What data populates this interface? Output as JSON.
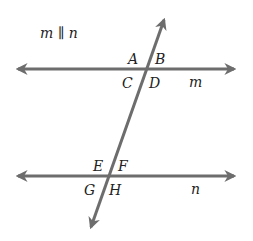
{
  "diagram": {
    "title": "m ∥ n",
    "line_color": "#6d6d6d",
    "lines": {
      "m": {
        "label": "m",
        "x1": 14,
        "y1": 69,
        "x2": 238,
        "y2": 69
      },
      "n": {
        "label": "n",
        "x1": 14,
        "y1": 176,
        "x2": 238,
        "y2": 176
      },
      "transversal": {
        "x1": 166,
        "y1": 15,
        "x2": 89,
        "y2": 232
      }
    },
    "angles": {
      "A": "A",
      "B": "B",
      "C": "C",
      "D": "D",
      "E": "E",
      "F": "F",
      "G": "G",
      "H": "H"
    }
  }
}
